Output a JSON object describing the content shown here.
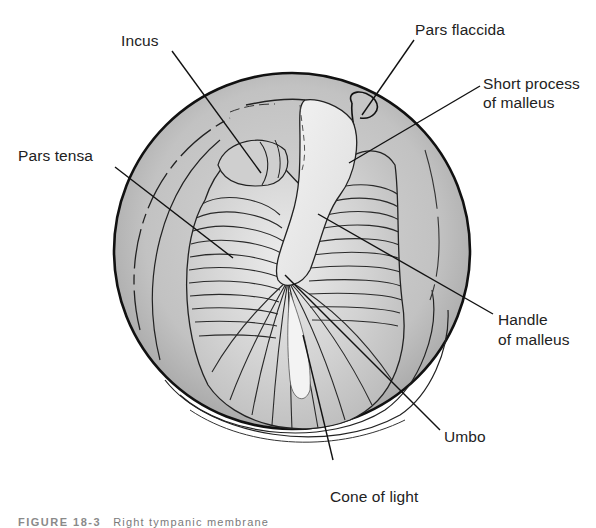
{
  "diagram": {
    "type": "anatomical-illustration",
    "colors": {
      "background": "#ffffff",
      "canal_wall": "#b9b9b9",
      "membrane": "#d4d4d4",
      "highlight": "#eeeeee",
      "outline": "#111111",
      "label_text": "#222222",
      "caption_text": "#7a7a7a"
    }
  },
  "labels": {
    "incus": "Incus",
    "pars_flaccida": "Pars flaccida",
    "short_process_line1": "Short process",
    "short_process_line2": "of malleus",
    "pars_tensa": "Pars tensa",
    "handle_line1": "Handle",
    "handle_line2": "of malleus",
    "umbo": "Umbo",
    "cone_of_light": "Cone of light"
  },
  "caption": {
    "number": "FIGURE 18-3",
    "text": "Right tympanic membrane"
  }
}
